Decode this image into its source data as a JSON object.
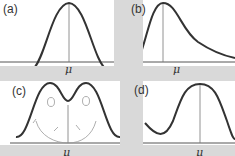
{
  "figure": {
    "panels": [
      {
        "id": "a",
        "label": "(a)",
        "axis_label": "μ",
        "shape": "symmetric-unimodal"
      },
      {
        "id": "b",
        "label": "(b)",
        "axis_label": "μ",
        "shape": "right-skewed"
      },
      {
        "id": "c",
        "label": "(c)",
        "axis_label": "μ",
        "shape": "bimodal"
      },
      {
        "id": "d",
        "label": "(d)",
        "axis_label": "μ",
        "shape": "symmetric-unimodal-narrow"
      }
    ]
  },
  "colors": {
    "background": "#d9d9d9",
    "panel": "#ffffff",
    "curve": "#333333",
    "axis": "#555555",
    "sketch": "#999999"
  }
}
